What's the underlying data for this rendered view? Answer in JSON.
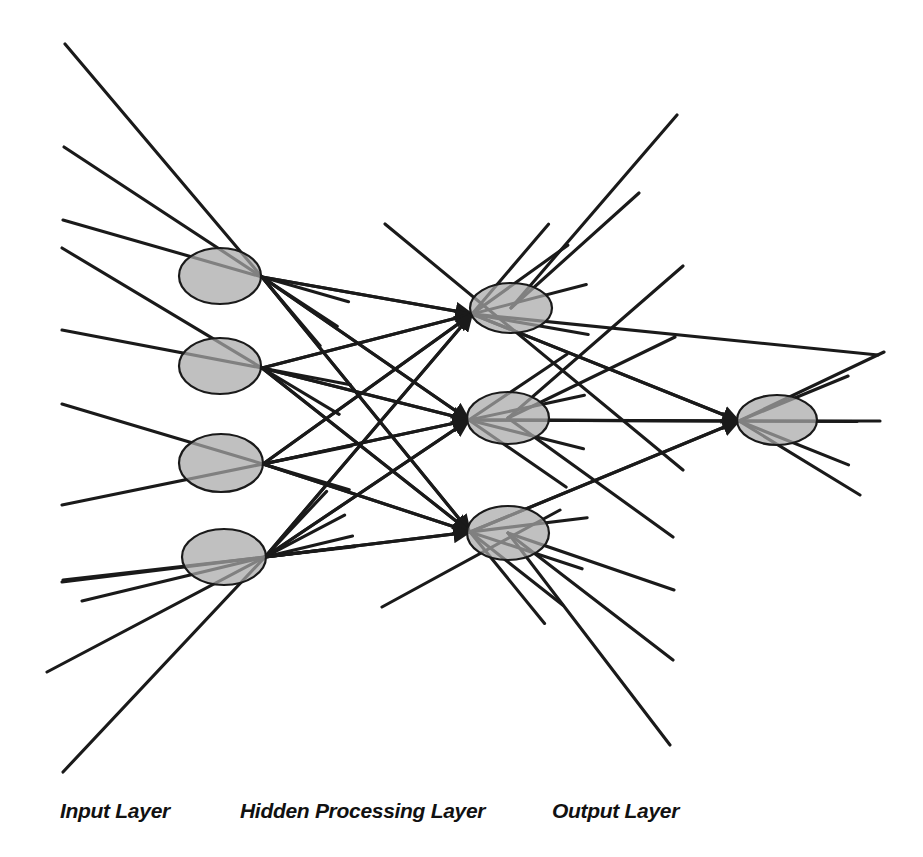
{
  "diagram": {
    "type": "neural-network",
    "background_color": "#ffffff",
    "node_fill_color": "#a8a8a8",
    "node_stroke_color": "#1a1a1a",
    "edge_color": "#1a1a1a",
    "label_color": "#111111",
    "labels": [
      {
        "id": "input-layer-label",
        "text": "Input Layer",
        "x": 60,
        "y": 818
      },
      {
        "id": "hidden-layer-label",
        "text": "Hidden Processing Layer",
        "x": 240,
        "y": 818
      },
      {
        "id": "output-layer-label",
        "text": "Output Layer",
        "x": 552,
        "y": 818
      }
    ],
    "layers": [
      {
        "id": "input",
        "name": "Input Layer",
        "node_count": 4,
        "nodes": [
          {
            "id": "in-1",
            "cx": 220,
            "cy": 276,
            "rx": 41,
            "ry": 28,
            "hub_x": 262,
            "hub_y": 277
          },
          {
            "id": "in-2",
            "cx": 220,
            "cy": 366,
            "rx": 41,
            "ry": 28,
            "hub_x": 262,
            "hub_y": 368
          },
          {
            "id": "in-3",
            "cx": 221,
            "cy": 463,
            "rx": 42,
            "ry": 29,
            "hub_x": 263,
            "hub_y": 464
          },
          {
            "id": "in-4",
            "cx": 224,
            "cy": 557,
            "rx": 42,
            "ry": 28,
            "hub_x": 265,
            "hub_y": 557
          }
        ]
      },
      {
        "id": "hidden",
        "name": "Hidden Processing Layer",
        "node_count": 3,
        "nodes": [
          {
            "id": "hid-1",
            "cx": 511,
            "cy": 308,
            "rx": 41,
            "ry": 25,
            "hub_x": 472,
            "hub_y": 314
          },
          {
            "id": "hid-2",
            "cx": 508,
            "cy": 418,
            "rx": 41,
            "ry": 26,
            "hub_x": 469,
            "hub_y": 420
          },
          {
            "id": "hid-3",
            "cx": 508,
            "cy": 533,
            "rx": 41,
            "ry": 27,
            "hub_x": 470,
            "hub_y": 532
          }
        ]
      },
      {
        "id": "output",
        "name": "Output Layer",
        "node_count": 1,
        "nodes": [
          {
            "id": "out-1",
            "cx": 777,
            "cy": 420,
            "rx": 40,
            "ry": 25,
            "hub_x": 739,
            "hub_y": 421
          }
        ]
      }
    ],
    "input_stubs": [
      {
        "id": "stub-in-1a",
        "x1": 65,
        "y1": 44,
        "x2": 262,
        "y2": 277
      },
      {
        "id": "stub-in-1b",
        "x1": 64,
        "y1": 147,
        "x2": 262,
        "y2": 277
      },
      {
        "id": "stub-in-1c",
        "x1": 63,
        "y1": 220,
        "x2": 262,
        "y2": 277
      },
      {
        "id": "stub-in-2a",
        "x1": 62,
        "y1": 248,
        "x2": 262,
        "y2": 368
      },
      {
        "id": "stub-in-2b",
        "x1": 62,
        "y1": 330,
        "x2": 262,
        "y2": 368
      },
      {
        "id": "stub-in-3a",
        "x1": 62,
        "y1": 404,
        "x2": 263,
        "y2": 464
      },
      {
        "id": "stub-in-3b",
        "x1": 62,
        "y1": 505,
        "x2": 263,
        "y2": 464
      },
      {
        "id": "stub-in-4a",
        "x1": 62,
        "y1": 582,
        "x2": 265,
        "y2": 557
      },
      {
        "id": "stub-in-4b",
        "x1": 63,
        "y1": 580,
        "x2": 265,
        "y2": 557
      },
      {
        "id": "stub-in-4c",
        "x1": 82,
        "y1": 601,
        "x2": 265,
        "y2": 557
      },
      {
        "id": "stub-in-4d",
        "x1": 47,
        "y1": 672,
        "x2": 265,
        "y2": 557
      },
      {
        "id": "stub-in-4e",
        "x1": 63,
        "y1": 772,
        "x2": 265,
        "y2": 557
      }
    ],
    "connections": [
      {
        "id": "e-in1-hid1",
        "from": "in-1",
        "to": "hid-1"
      },
      {
        "id": "e-in1-hid2",
        "from": "in-1",
        "to": "hid-2"
      },
      {
        "id": "e-in1-hid3",
        "from": "in-1",
        "to": "hid-3"
      },
      {
        "id": "e-in2-hid1",
        "from": "in-2",
        "to": "hid-1"
      },
      {
        "id": "e-in2-hid2",
        "from": "in-2",
        "to": "hid-2"
      },
      {
        "id": "e-in2-hid3",
        "from": "in-2",
        "to": "hid-3"
      },
      {
        "id": "e-in3-hid1",
        "from": "in-3",
        "to": "hid-1"
      },
      {
        "id": "e-in3-hid2",
        "from": "in-3",
        "to": "hid-2"
      },
      {
        "id": "e-in3-hid3",
        "from": "in-3",
        "to": "hid-3"
      },
      {
        "id": "e-in4-hid1",
        "from": "in-4",
        "to": "hid-1"
      },
      {
        "id": "e-in4-hid2",
        "from": "in-4",
        "to": "hid-2"
      },
      {
        "id": "e-in4-hid3",
        "from": "in-4",
        "to": "hid-3"
      },
      {
        "id": "e-hid1-out1",
        "from": "hid-1",
        "to": "out-1"
      },
      {
        "id": "e-hid2-out1",
        "from": "hid-2",
        "to": "out-1"
      },
      {
        "id": "e-hid3-out1",
        "from": "hid-3",
        "to": "out-1"
      }
    ],
    "output_stubs": [
      {
        "id": "stub-out-a",
        "x1": 511,
        "y1": 308,
        "x2": 677,
        "y2": 115
      },
      {
        "id": "stub-out-b",
        "x1": 511,
        "y1": 308,
        "x2": 639,
        "y2": 193
      },
      {
        "id": "stub-out-c",
        "x1": 385,
        "y1": 224,
        "x2": 683,
        "y2": 470
      },
      {
        "id": "stub-out-d",
        "x1": 472,
        "y1": 314,
        "x2": 878,
        "y2": 355
      },
      {
        "id": "stub-out-e",
        "x1": 508,
        "y1": 418,
        "x2": 683,
        "y2": 266
      },
      {
        "id": "stub-out-f",
        "x1": 508,
        "y1": 418,
        "x2": 675,
        "y2": 337
      },
      {
        "id": "stub-out-g",
        "x1": 508,
        "y1": 418,
        "x2": 673,
        "y2": 537
      },
      {
        "id": "stub-out-h",
        "x1": 508,
        "y1": 533,
        "x2": 674,
        "y2": 590
      },
      {
        "id": "stub-out-i",
        "x1": 508,
        "y1": 533,
        "x2": 673,
        "y2": 660
      },
      {
        "id": "stub-out-j",
        "x1": 508,
        "y1": 533,
        "x2": 670,
        "y2": 745
      },
      {
        "id": "stub-out-k",
        "x1": 382,
        "y1": 607,
        "x2": 560,
        "y2": 510
      },
      {
        "id": "stub-out-l",
        "x1": 739,
        "y1": 421,
        "x2": 880,
        "y2": 421
      },
      {
        "id": "stub-out-m",
        "x1": 739,
        "y1": 421,
        "x2": 884,
        "y2": 352
      },
      {
        "id": "stub-out-n",
        "x1": 739,
        "y1": 421,
        "x2": 860,
        "y2": 495
      }
    ]
  }
}
